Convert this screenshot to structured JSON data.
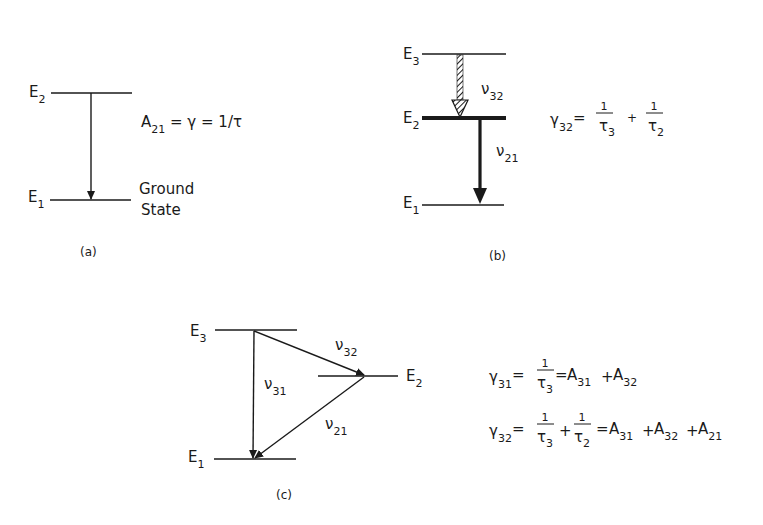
{
  "panels": {
    "a": {
      "caption": "(a)",
      "levels": [
        {
          "name": "E",
          "sub": "2"
        },
        {
          "name": "E",
          "sub": "1"
        }
      ],
      "ground_label_line1": "Ground",
      "ground_label_line2": "State",
      "equation": {
        "A": "A",
        "A_sub": "21",
        "rest": " = γ = 1/τ"
      }
    },
    "b": {
      "caption": "(b)",
      "levels": [
        {
          "name": "E",
          "sub": "3"
        },
        {
          "name": "E",
          "sub": "2"
        },
        {
          "name": "E",
          "sub": "1"
        }
      ],
      "transitions": [
        {
          "name": "ν",
          "sub": "32",
          "style": "hatched"
        },
        {
          "name": "ν",
          "sub": "21",
          "style": "thick"
        }
      ],
      "equation": {
        "gamma": "γ",
        "gamma_sub": "32",
        "eq": "=",
        "t1_num": "1",
        "t1_den": "τ",
        "t1_den_sub": "3",
        "plus": "+",
        "t2_num": "1",
        "t2_den": "τ",
        "t2_den_sub": "2"
      }
    },
    "c": {
      "caption": "(c)",
      "levels": [
        {
          "name": "E",
          "sub": "3"
        },
        {
          "name": "E",
          "sub": "2"
        },
        {
          "name": "E",
          "sub": "1"
        }
      ],
      "transitions": [
        {
          "name": "ν",
          "sub": "32"
        },
        {
          "name": "ν",
          "sub": "31"
        },
        {
          "name": "ν",
          "sub": "21"
        }
      ],
      "equations": [
        {
          "gamma": "γ",
          "gamma_sub": "31",
          "eq1": "=",
          "num": "1",
          "den": "τ",
          "den_sub": "3",
          "eq2": "=",
          "terms": [
            {
              "A": "A",
              "sub": "31"
            },
            {
              "A": "A",
              "sub": "32"
            }
          ],
          "plus": "+"
        },
        {
          "gamma": "γ",
          "gamma_sub": "32",
          "eq1": "=",
          "num1": "1",
          "den1": "τ",
          "den1_sub": "3",
          "plus_frac": "+",
          "num2": "1",
          "den2": "τ",
          "den2_sub": "2",
          "eq2": "=",
          "terms": [
            {
              "A": "A",
              "sub": "31"
            },
            {
              "A": "A",
              "sub": "32"
            },
            {
              "A": "A",
              "sub": "21"
            }
          ],
          "plus": "+"
        }
      ]
    }
  },
  "colors": {
    "ink": "#1a1a1a",
    "background": "#ffffff"
  }
}
